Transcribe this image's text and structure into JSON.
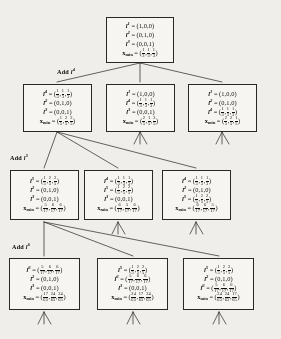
{
  "figure": {
    "type": "tree-diagram",
    "labels": {
      "l1": "l",
      "l2": "l",
      "l3": "l",
      "xmin": "x",
      "xmin_sub": "min",
      "equals": "="
    },
    "add_labels": [
      {
        "text": "Add l",
        "sup": "4"
      },
      {
        "text": "Add l",
        "sup": "5"
      },
      {
        "text": "Add l",
        "sup": "6"
      }
    ],
    "nodes": [
      {
        "id": "root",
        "rows": [
          {
            "sym": "l",
            "sup": "1",
            "vec": "(1,0,0)"
          },
          {
            "sym": "l",
            "sup": "2",
            "vec": "(0,1,0)"
          },
          {
            "sym": "l",
            "sup": "3",
            "vec": "(0,0,1)"
          },
          {
            "sym": "x",
            "sub": "min",
            "frac_vec": [
              [
                "1",
                "3"
              ],
              [
                "1",
                "3"
              ],
              [
                "1",
                "3"
              ]
            ]
          }
        ]
      },
      {
        "id": "n2a",
        "rows": [
          {
            "sym": "l",
            "sup": "4",
            "frac_vec": [
              [
                "1",
                "3"
              ],
              [
                "1",
                "3"
              ],
              [
                "1",
                "3"
              ]
            ]
          },
          {
            "sym": "l",
            "sup": "2",
            "vec": "(0,1,0)"
          },
          {
            "sym": "l",
            "sup": "3",
            "vec": "(0,0,1)"
          },
          {
            "sym": "x",
            "sub": "min",
            "frac_vec": [
              [
                "1",
                "5"
              ],
              [
                "2",
                "5"
              ],
              [
                "2",
                "5"
              ]
            ]
          }
        ]
      },
      {
        "id": "n2b",
        "rows": [
          {
            "sym": "l",
            "sup": "1",
            "vec": "(1,0,0)"
          },
          {
            "sym": "l",
            "sup": "4",
            "frac_vec": [
              [
                "1",
                "3"
              ],
              [
                "1",
                "3"
              ],
              [
                "1",
                "3"
              ]
            ]
          },
          {
            "sym": "l",
            "sup": "3",
            "vec": "(0,0,1)"
          },
          {
            "sym": "x",
            "sub": "min",
            "frac_vec": [
              [
                "2",
                "5"
              ],
              [
                "1",
                "5"
              ],
              [
                "2",
                "5"
              ]
            ]
          }
        ]
      },
      {
        "id": "n2c",
        "rows": [
          {
            "sym": "l",
            "sup": "1",
            "vec": "(1,0,0)"
          },
          {
            "sym": "l",
            "sup": "2",
            "vec": "(0,1,0)"
          },
          {
            "sym": "l",
            "sup": "4",
            "frac_vec": [
              [
                "1",
                "3"
              ],
              [
                "1",
                "3"
              ],
              [
                "1",
                "3"
              ]
            ]
          },
          {
            "sym": "x",
            "sub": "min",
            "frac_vec": [
              [
                "2",
                "5"
              ],
              [
                "2",
                "5"
              ],
              [
                "1",
                "5"
              ]
            ]
          }
        ]
      },
      {
        "id": "n3a",
        "rows": [
          {
            "sym": "l",
            "sup": "5",
            "frac_vec": [
              [
                "1",
                "5"
              ],
              [
                "2",
                "5"
              ],
              [
                "2",
                "5"
              ]
            ]
          },
          {
            "sym": "l",
            "sup": "2",
            "vec": "(0,1,0)"
          },
          {
            "sym": "l",
            "sup": "3",
            "vec": "(0,0,1)"
          },
          {
            "sym": "x",
            "sub": "min",
            "frac_vec": [
              [
                "5",
                "17"
              ],
              [
                "6",
                "17"
              ],
              [
                "6",
                "17"
              ]
            ]
          }
        ]
      },
      {
        "id": "n3b",
        "rows": [
          {
            "sym": "l",
            "sup": "4",
            "frac_vec": [
              [
                "1",
                "3"
              ],
              [
                "1",
                "3"
              ],
              [
                "1",
                "3"
              ]
            ]
          },
          {
            "sym": "l",
            "sup": "5",
            "frac_vec": [
              [
                "1",
                "5"
              ],
              [
                "2",
                "5"
              ],
              [
                "2",
                "5"
              ]
            ]
          },
          {
            "sym": "l",
            "sup": "3",
            "vec": "(0,0,1)"
          },
          {
            "sym": "x",
            "sub": "min",
            "frac_vec": [
              [
                "6",
                "17"
              ],
              [
                "5",
                "17"
              ],
              [
                "6",
                "17"
              ]
            ]
          }
        ]
      },
      {
        "id": "n3c",
        "rows": [
          {
            "sym": "l",
            "sup": "4",
            "frac_vec": [
              [
                "1",
                "3"
              ],
              [
                "1",
                "3"
              ],
              [
                "1",
                "3"
              ]
            ]
          },
          {
            "sym": "l",
            "sup": "2",
            "vec": "(0,1,0)"
          },
          {
            "sym": "l",
            "sup": "5",
            "frac_vec": [
              [
                "1",
                "5"
              ],
              [
                "2",
                "5"
              ],
              [
                "2",
                "5"
              ]
            ]
          },
          {
            "sym": "x",
            "sub": "min",
            "frac_vec": [
              [
                "6",
                "17"
              ],
              [
                "6",
                "17"
              ],
              [
                "5",
                "17"
              ]
            ]
          }
        ]
      },
      {
        "id": "n4a",
        "rows": [
          {
            "sym": "l",
            "sup": "6",
            "frac_vec": [
              [
                "5",
                "17"
              ],
              [
                "6",
                "17"
              ],
              [
                "6",
                "17"
              ]
            ]
          },
          {
            "sym": "l",
            "sup": "2",
            "vec": "(0,1,0)"
          },
          {
            "sym": "l",
            "sup": "3",
            "vec": "(0,0,1)"
          },
          {
            "sym": "x",
            "sub": "min",
            "frac_vec": [
              [
                "17",
                "65"
              ],
              [
                "24",
                "65"
              ],
              [
                "24",
                "65"
              ]
            ]
          }
        ]
      },
      {
        "id": "n4b",
        "rows": [
          {
            "sym": "l",
            "sup": "5",
            "frac_vec": [
              [
                "1",
                "5"
              ],
              [
                "2",
                "5"
              ],
              [
                "2",
                "5"
              ]
            ]
          },
          {
            "sym": "l",
            "sup": "6",
            "frac_vec": [
              [
                "5",
                "17"
              ],
              [
                "6",
                "17"
              ],
              [
                "6",
                "17"
              ]
            ]
          },
          {
            "sym": "l",
            "sup": "3",
            "vec": "(0,0,1)"
          },
          {
            "sym": "x",
            "sub": "min",
            "frac_vec": [
              [
                "24",
                "65"
              ],
              [
                "17",
                "65"
              ],
              [
                "24",
                "65"
              ]
            ]
          }
        ]
      },
      {
        "id": "n4c",
        "rows": [
          {
            "sym": "l",
            "sup": "5",
            "frac_vec": [
              [
                "1",
                "5"
              ],
              [
                "2",
                "5"
              ],
              [
                "2",
                "5"
              ]
            ]
          },
          {
            "sym": "l",
            "sup": "2",
            "vec": "(0,1,0)"
          },
          {
            "sym": "l",
            "sup": "6",
            "frac_vec": [
              [
                "5",
                "17"
              ],
              [
                "6",
                "17"
              ],
              [
                "6",
                "17"
              ]
            ]
          },
          {
            "sym": "x",
            "sub": "min",
            "frac_vec": [
              [
                "24",
                "65"
              ],
              [
                "24",
                "65"
              ],
              [
                "17",
                "65"
              ]
            ]
          }
        ]
      }
    ]
  }
}
